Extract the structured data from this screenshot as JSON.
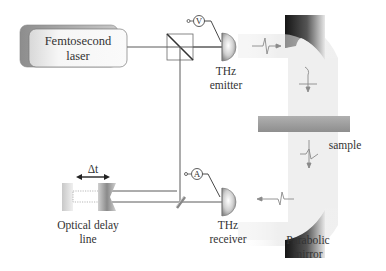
{
  "diagram": {
    "components": {
      "laser": {
        "label_line1": "Femtosecond",
        "label_line2": "laser"
      },
      "emitter": {
        "label_line1": "THz",
        "label_line2": "emitter",
        "meter_symbol": "V"
      },
      "receiver": {
        "label_line1": "THz",
        "label_line2": "receiver",
        "meter_symbol": "A"
      },
      "delay_line": {
        "label_line1": "Optical delay",
        "label_line2": "line",
        "delta_label": "Δt"
      },
      "sample": {
        "label": "sample"
      },
      "mirror": {
        "label_line1": "Parabolic",
        "label_line2": "mirror"
      },
      "beam_splitter": {
        "label": ""
      }
    },
    "colors": {
      "line": "#555555",
      "text": "#333333",
      "beam": "#ececec",
      "mirror_dark": "#1a1a1a",
      "sample": "#9a9a9a",
      "laser_body": "#f2f2f2",
      "laser_shadow": "#b5b5b5"
    }
  }
}
